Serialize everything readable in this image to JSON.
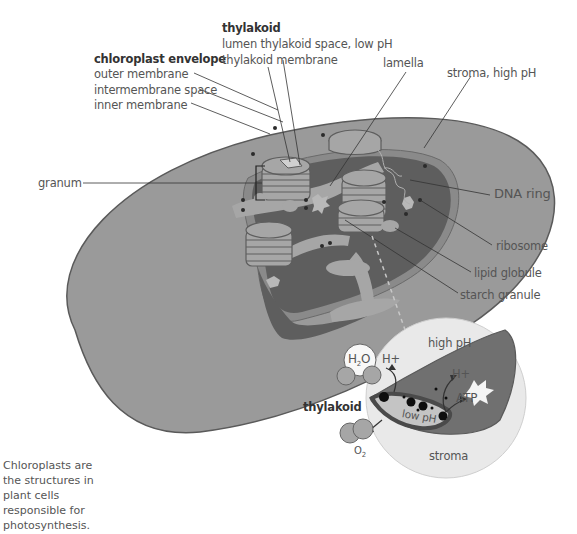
{
  "diagram": {
    "title": "Chloroplast",
    "colors": {
      "outer": "#9a9a9a",
      "outer_stroke": "#5a5a5a",
      "band": "#8a8a8a",
      "stroma": "#5e5e5e",
      "thylakoid": "#a6a6a6",
      "detail_circle": "#e9e9e9",
      "label_text": "#555555",
      "line": "#333333"
    },
    "labels": {
      "chloroplast_envelope": {
        "heading": "chloroplast envelope",
        "items": [
          "outer membrane",
          "intermembrane space",
          "inner membrane"
        ]
      },
      "thylakoid": {
        "heading": "thylakoid",
        "items": [
          "lumen thylakoid space, low pH",
          "thylakoid membrane"
        ]
      },
      "lamella": "lamella",
      "stroma": "stroma, high pH",
      "granum": "granum",
      "dna_ring": "DNA ring",
      "ribosome": "ribosome",
      "lipid_globule": "lipid globule",
      "starch_granule": "starch granule"
    },
    "inset": {
      "high_ph": "high pH",
      "h2o_main": "H",
      "h2o_sub": "2",
      "h2o_end": "O",
      "h_plus_in": "H+",
      "h_plus_out": "H+",
      "atp": "ATP",
      "low_ph": "low pH",
      "o2_main": "O",
      "o2_sub": "2",
      "stroma": "stroma",
      "thylakoid": "thylakoid"
    },
    "caption": "Chloroplasts are the structures in plant cells responsible for photosynthesis."
  }
}
